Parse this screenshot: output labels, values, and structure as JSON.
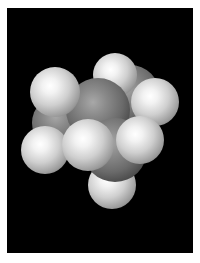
{
  "image": {
    "description": "Space-filling (CPK) molecular model of a small hydrocarbon rendered in grayscale on a black background",
    "background_color": "#000000",
    "border_color": "#ffffff",
    "atoms": [
      {
        "element": "C",
        "label": "carbon-left",
        "cx": 60,
        "cy": 123,
        "r": 28
      },
      {
        "element": "C",
        "label": "carbon-right",
        "cx": 130,
        "cy": 95,
        "r": 30
      },
      {
        "element": "H",
        "label": "hydrogen-top",
        "cx": 115,
        "cy": 75,
        "r": 22
      },
      {
        "element": "H",
        "label": "hydrogen-right",
        "cx": 155,
        "cy": 102,
        "r": 24
      },
      {
        "element": "C",
        "label": "carbon-center",
        "cx": 98,
        "cy": 110,
        "r": 32
      },
      {
        "element": "H",
        "label": "hydrogen-top-left",
        "cx": 55,
        "cy": 92,
        "r": 25
      },
      {
        "element": "H",
        "label": "hydrogen-left-lower",
        "cx": 45,
        "cy": 150,
        "r": 24
      },
      {
        "element": "H",
        "label": "hydrogen-bottom",
        "cx": 112,
        "cy": 185,
        "r": 24
      },
      {
        "element": "C",
        "label": "carbon-front",
        "cx": 115,
        "cy": 150,
        "r": 32
      },
      {
        "element": "H",
        "label": "hydrogen-front-right",
        "cx": 140,
        "cy": 140,
        "r": 24
      },
      {
        "element": "H",
        "label": "hydrogen-front-left",
        "cx": 88,
        "cy": 145,
        "r": 26
      }
    ]
  }
}
